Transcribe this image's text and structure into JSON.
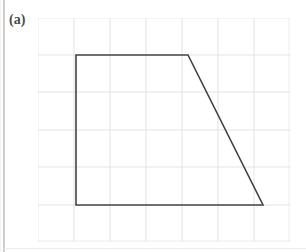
{
  "figure": {
    "label": "(a)",
    "caption_text": "(a)"
  },
  "grid": {
    "columns": 7,
    "rows": 6,
    "cell_width": 36,
    "cell_height": 37.33,
    "origin_x": 38,
    "origin_y": 18,
    "line_color": "#e3e3e3",
    "outer_border_color": "#ececec",
    "background_color": "#ffffff"
  },
  "shape": {
    "name": "trapezoid",
    "stroke_color": "#444444",
    "stroke_width": 1.6,
    "fill": "none",
    "vertices_px": [
      {
        "label": "top-left",
        "x": 76,
        "y": 55
      },
      {
        "label": "top-right",
        "x": 188,
        "y": 55
      },
      {
        "label": "bottom-right",
        "x": 263,
        "y": 205
      },
      {
        "label": "bottom-left",
        "x": 76,
        "y": 205
      }
    ],
    "vertices_grid_units": [
      {
        "label": "top-left",
        "col": 1,
        "row": 1
      },
      {
        "label": "top-right",
        "col": 4,
        "row": 1
      },
      {
        "label": "bottom-right",
        "col": 6,
        "row": 5
      },
      {
        "label": "bottom-left",
        "col": 1,
        "row": 5
      }
    ],
    "path_d": "M 38 37 L 150 37 L 225 187 L 38 187 Z",
    "side_lengths_grid_units": {
      "top": 3,
      "bottom": 5,
      "left": 4,
      "slant": 5
    }
  },
  "page": {
    "edge_artifact_color": "#bdbdbd",
    "background_color": "#ffffff"
  }
}
